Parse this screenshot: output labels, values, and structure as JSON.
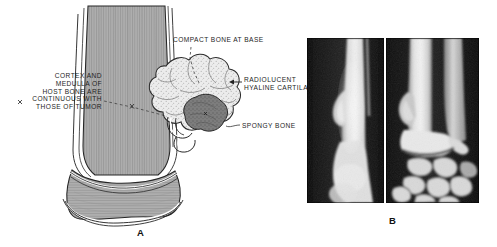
{
  "figure": {
    "domain": "medical-illustration",
    "background_color": "#ffffff",
    "width": 497,
    "height": 247
  },
  "panel_a": {
    "letter": "A",
    "type": "line-drawing",
    "subject": "osteochondroma on distal long bone",
    "colors": {
      "bone_fill": "#a8a8a8",
      "bone_outline": "#1d1d1d",
      "cortex_highlight": "#ffffff",
      "tumor_spongy_fill": "#787878",
      "tumor_cartilage_fill": "#e8e8e8",
      "label_text": "#1d1d1d"
    },
    "labels": [
      {
        "id": "cortex",
        "text": "CORTEX AND\nMEDULLA OF\nHOST BONE ARE\nCONTINUOUS WITH\nTHOSE OF TUMOR",
        "align": "right",
        "leader": "dashed-with-x-marker"
      },
      {
        "id": "compact",
        "text": "COMPACT BONE AT BASE",
        "align": "left",
        "leader": "dashed-vertical"
      },
      {
        "id": "radiolucent",
        "text": "RADIOLUCENT\nHYALINE CARTILAGE",
        "align": "left",
        "leader": "arrow-left",
        "note": "text clipped by right radiograph panel"
      },
      {
        "id": "spongy",
        "text": "SPONGY BONE",
        "align": "left",
        "leader": "hook"
      }
    ]
  },
  "panel_b": {
    "letter": "B",
    "type": "radiograph-pair",
    "background_color": "#0a0a0a",
    "images": [
      {
        "id": "xray-lateral",
        "view": "lateral",
        "region": "distal forearm",
        "finding": "pedunculated exostosis projecting from metaphyseal cortex"
      },
      {
        "id": "xray-ap",
        "view": "anteroposterior",
        "region": "wrist",
        "finding": "radius and ulna with carpal bones; metaphyseal exostosis"
      }
    ]
  }
}
